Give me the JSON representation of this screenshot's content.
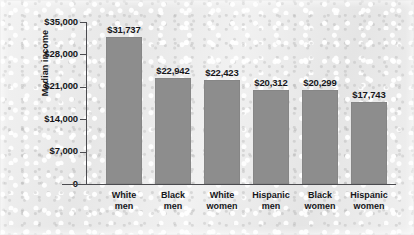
{
  "chart_data": {
    "type": "bar",
    "title": "",
    "xlabel": "",
    "ylabel": "Median income",
    "ylim": [
      0,
      35000
    ],
    "grid": false,
    "legend": null,
    "categories": [
      "White men",
      "Black men",
      "White women",
      "Hispanic men",
      "Black women",
      "Hispanic women"
    ],
    "category_lines": [
      [
        "White",
        "men"
      ],
      [
        "Black",
        "men"
      ],
      [
        "White",
        "women"
      ],
      [
        "Hispanic",
        "men"
      ],
      [
        "Black",
        "women"
      ],
      [
        "Hispanic",
        "women"
      ]
    ],
    "values": [
      31737,
      22942,
      22423,
      20312,
      20299,
      17743
    ],
    "data_labels": [
      "$31,737",
      "$22,942",
      "$22,423",
      "$20,312",
      "$20,299",
      "$17,743"
    ],
    "ytick_values": [
      0,
      7000,
      14000,
      21000,
      28000,
      35000
    ],
    "ytick_labels": [
      "0",
      "$7,000",
      "$14,000",
      "$21,000",
      "$28,000",
      "$35,000"
    ],
    "bar_color": "#8d8d8d",
    "axis_color": "#4b4b4f",
    "text_color": "#15161a",
    "background_color": "#ebebeb"
  }
}
